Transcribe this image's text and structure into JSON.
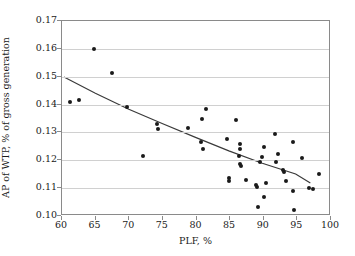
{
  "chart_data": {
    "type": "scatter",
    "title": "",
    "xlabel": "PLF, %",
    "ylabel": "AP of WTP, % of gross generation",
    "xlim": [
      60,
      100
    ],
    "ylim": [
      0.1,
      0.17
    ],
    "xticks": [
      60,
      65,
      70,
      75,
      80,
      85,
      90,
      95,
      100
    ],
    "yticks": [
      "0.10",
      "0.11",
      "0.12",
      "0.13",
      "0.14",
      "0.15",
      "0.16",
      "0.17"
    ],
    "grid": "horizontal",
    "legend": "none",
    "marker_color": "#1a1a1a",
    "trendline_color": "#3a3a3a",
    "points": [
      {
        "x": 61.2,
        "y": 0.141
      },
      {
        "x": 62.6,
        "y": 0.1415
      },
      {
        "x": 64.7,
        "y": 0.1598
      },
      {
        "x": 67.4,
        "y": 0.1513
      },
      {
        "x": 69.7,
        "y": 0.1392
      },
      {
        "x": 72.1,
        "y": 0.1215
      },
      {
        "x": 74.2,
        "y": 0.1332
      },
      {
        "x": 74.3,
        "y": 0.1313
      },
      {
        "x": 78.7,
        "y": 0.1317
      },
      {
        "x": 80.6,
        "y": 0.1265
      },
      {
        "x": 80.8,
        "y": 0.1348
      },
      {
        "x": 81.0,
        "y": 0.1239
      },
      {
        "x": 81.4,
        "y": 0.1383
      },
      {
        "x": 84.5,
        "y": 0.1278
      },
      {
        "x": 84.8,
        "y": 0.1138
      },
      {
        "x": 84.9,
        "y": 0.1125
      },
      {
        "x": 85.9,
        "y": 0.1343
      },
      {
        "x": 86.3,
        "y": 0.1216
      },
      {
        "x": 86.4,
        "y": 0.1258
      },
      {
        "x": 86.5,
        "y": 0.1239
      },
      {
        "x": 86.5,
        "y": 0.1186
      },
      {
        "x": 86.6,
        "y": 0.1178
      },
      {
        "x": 87.4,
        "y": 0.1131
      },
      {
        "x": 88.9,
        "y": 0.111
      },
      {
        "x": 89.0,
        "y": 0.1104
      },
      {
        "x": 89.2,
        "y": 0.1032
      },
      {
        "x": 89.4,
        "y": 0.1194
      },
      {
        "x": 89.7,
        "y": 0.1212
      },
      {
        "x": 90.0,
        "y": 0.1249
      },
      {
        "x": 90.1,
        "y": 0.1067
      },
      {
        "x": 90.4,
        "y": 0.1118
      },
      {
        "x": 91.6,
        "y": 0.1294
      },
      {
        "x": 91.8,
        "y": 0.1193
      },
      {
        "x": 92.1,
        "y": 0.1221
      },
      {
        "x": 92.8,
        "y": 0.1164
      },
      {
        "x": 93.0,
        "y": 0.1157
      },
      {
        "x": 93.3,
        "y": 0.1127
      },
      {
        "x": 94.3,
        "y": 0.1266
      },
      {
        "x": 94.4,
        "y": 0.1089
      },
      {
        "x": 94.5,
        "y": 0.1022
      },
      {
        "x": 95.7,
        "y": 0.1208
      },
      {
        "x": 96.7,
        "y": 0.1101
      },
      {
        "x": 97.3,
        "y": 0.1096
      },
      {
        "x": 98.2,
        "y": 0.1152
      }
    ],
    "trendline": {
      "type": "power-fit",
      "points": [
        {
          "x": 60.3,
          "y": 0.1497
        },
        {
          "x": 65.0,
          "y": 0.1438
        },
        {
          "x": 70.0,
          "y": 0.138
        },
        {
          "x": 75.0,
          "y": 0.1328
        },
        {
          "x": 80.0,
          "y": 0.1278
        },
        {
          "x": 85.0,
          "y": 0.1229
        },
        {
          "x": 90.0,
          "y": 0.1184
        },
        {
          "x": 95.0,
          "y": 0.1145
        },
        {
          "x": 97.2,
          "y": 0.1112
        }
      ]
    }
  }
}
